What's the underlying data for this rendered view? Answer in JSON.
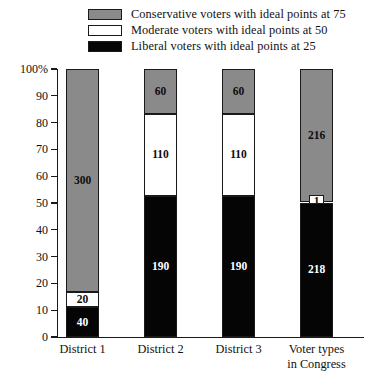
{
  "chart_data": {
    "type": "bar",
    "stacked": true,
    "title": "",
    "xlabel": "",
    "ylabel": "",
    "ylim": [
      0,
      100
    ],
    "ytick_labels": [
      "100%",
      "90",
      "80",
      "70",
      "60",
      "50",
      "40",
      "30",
      "20",
      "10",
      "0"
    ],
    "ytick_values": [
      100,
      90,
      80,
      70,
      60,
      50,
      40,
      30,
      20,
      10,
      0
    ],
    "grid": false,
    "legend_position": "top",
    "categories": [
      "District 1",
      "District 2",
      "District 3",
      "Voter types in Congress"
    ],
    "category_lines": [
      [
        "District 1"
      ],
      [
        "District 2"
      ],
      [
        "District 3"
      ],
      [
        "Voter types",
        "in Congress"
      ]
    ],
    "series": [
      {
        "name": "Conservative voters with ideal points at 75",
        "color": "#8a8a8a",
        "values": [
          300,
          60,
          60,
          216
        ]
      },
      {
        "name": "Moderate voters with ideal points at 50",
        "color": "#ffffff",
        "values": [
          20,
          110,
          110,
          1
        ]
      },
      {
        "name": "Liberal voters with ideal points at 25",
        "color": "#050505",
        "values": [
          40,
          190,
          190,
          218
        ]
      }
    ],
    "totals": [
      360,
      360,
      360,
      435
    ],
    "bars": [
      {
        "category": "District 1",
        "segments": [
          {
            "label": "300",
            "value": 300,
            "type": "conservative",
            "pct_start": 16.6667,
            "pct_end": 100.0
          },
          {
            "label": "20",
            "value": 20,
            "type": "moderate",
            "pct_start": 11.1111,
            "pct_end": 16.6667
          },
          {
            "label": "40",
            "value": 40,
            "type": "liberal",
            "pct_start": 0.0,
            "pct_end": 11.1111
          }
        ]
      },
      {
        "category": "District 2",
        "segments": [
          {
            "label": "60",
            "value": 60,
            "type": "conservative",
            "pct_start": 83.3333,
            "pct_end": 100.0
          },
          {
            "label": "110",
            "value": 110,
            "type": "moderate",
            "pct_start": 52.7778,
            "pct_end": 83.3333
          },
          {
            "label": "190",
            "value": 190,
            "type": "liberal",
            "pct_start": 0.0,
            "pct_end": 52.7778
          }
        ]
      },
      {
        "category": "District 3",
        "segments": [
          {
            "label": "60",
            "value": 60,
            "type": "conservative",
            "pct_start": 83.3333,
            "pct_end": 100.0
          },
          {
            "label": "110",
            "value": 110,
            "type": "moderate",
            "pct_start": 52.7778,
            "pct_end": 83.3333
          },
          {
            "label": "190",
            "value": 190,
            "type": "liberal",
            "pct_start": 0.0,
            "pct_end": 52.7778
          }
        ]
      },
      {
        "category": "Voter types in Congress",
        "segments": [
          {
            "label": "216",
            "value": 216,
            "type": "conservative",
            "pct_start": 50.3448,
            "pct_end": 100.0
          },
          {
            "label": "1",
            "value": 1,
            "type": "moderate",
            "pct_start": 50.1149,
            "pct_end": 50.3448,
            "tiny": true
          },
          {
            "label": "218",
            "value": 218,
            "type": "liberal",
            "pct_start": 0.0,
            "pct_end": 50.1149
          }
        ]
      }
    ]
  },
  "legend": {
    "items": [
      {
        "label": "Conservative voters with ideal points at 75",
        "swatch": "conservative"
      },
      {
        "label": "Moderate voters with ideal points at 50",
        "swatch": "moderate"
      },
      {
        "label": "Liberal voters with ideal points at 25",
        "swatch": "liberal"
      }
    ]
  },
  "colors": {
    "conservative": "#8a8a8a",
    "moderate": "#ffffff",
    "liberal": "#050505",
    "axis": "#1a1a1a",
    "background": "#ffffff"
  }
}
